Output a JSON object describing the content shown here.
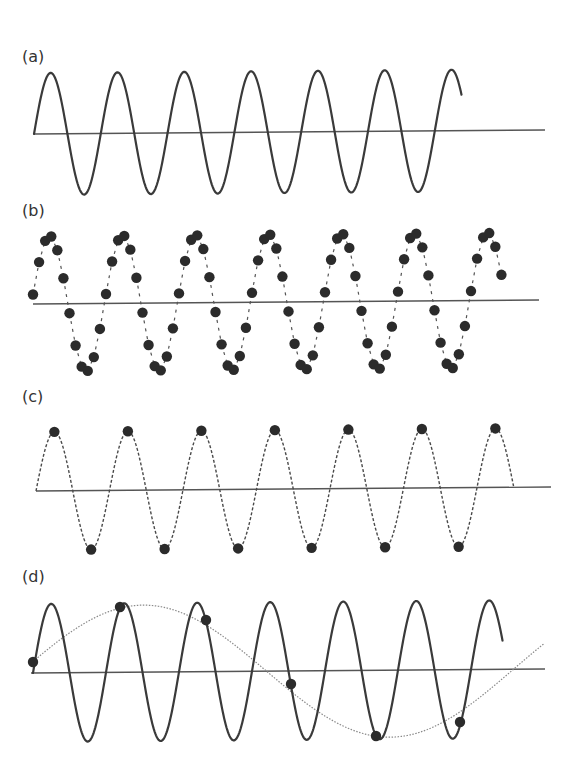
{
  "figure": {
    "colors": {
      "wave": "#3a3a3a",
      "axis": "#555555",
      "dots": "#2b2b2b",
      "alias": "#8a8a8a"
    },
    "panels": [
      {
        "id": "a",
        "label": "(a)",
        "label_pos": [
          22,
          62
        ],
        "axis": {
          "x0": 34,
          "y0": 134,
          "x1": 545,
          "y1": 130
        },
        "signal": {
          "style": "solid",
          "x_start": 34,
          "x_end": 462,
          "amplitude": 61,
          "period": 66.8,
          "phase_deg": 0
        }
      },
      {
        "id": "b",
        "label": "(b)",
        "label_pos": [
          22,
          216
        ],
        "axis": {
          "x0": 33,
          "y0": 304,
          "x1": 539,
          "y1": 300
        },
        "signal": {
          "style": "samples-dense",
          "x_start": 33,
          "amplitude": 68,
          "period": 73,
          "phase_deg": 8,
          "samples_per_cycle": 12,
          "cycles": 7,
          "last_cycle_samples": 6
        }
      },
      {
        "id": "c",
        "label": "(c)",
        "label_pos": [
          22,
          402
        ],
        "axis": {
          "x0": 36,
          "y0": 491,
          "x1": 551,
          "y1": 487
        },
        "signal": {
          "style": "dashed",
          "x_start": 36,
          "x_end": 514,
          "amplitude": 59,
          "period": 73.5,
          "phase_deg": 0,
          "samples_at": "peaks-and-troughs"
        }
      },
      {
        "id": "d",
        "label": "(d)",
        "label_pos": [
          22,
          582
        ],
        "axis": {
          "x0": 31,
          "y0": 673,
          "x1": 545,
          "y1": 669
        },
        "signal": {
          "style": "solid",
          "x_start": 33,
          "x_end": 503,
          "amplitude": 69,
          "period": 73,
          "phase_deg": 0
        },
        "samples": [
          [
            33,
            662
          ],
          [
            120,
            607
          ],
          [
            206,
            620
          ],
          [
            291,
            684
          ],
          [
            376,
            736
          ],
          [
            460,
            722
          ]
        ],
        "alias": {
          "style": "dotted",
          "x_start": 33,
          "x_end": 545,
          "amplitude": 67,
          "period": 494,
          "peak_x": 143
        }
      }
    ]
  }
}
